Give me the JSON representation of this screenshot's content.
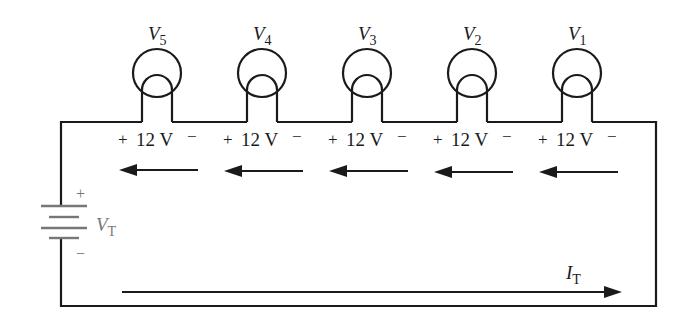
{
  "diagram": {
    "colors": {
      "wire": "#1a1a1a",
      "battery": "#777777",
      "background": "#ffffff"
    },
    "bulbs": [
      {
        "id": "V5",
        "label_main": "V",
        "label_sub": "5",
        "drop_plus": "+",
        "drop_value": "12 V",
        "drop_minus": "−"
      },
      {
        "id": "V4",
        "label_main": "V",
        "label_sub": "4",
        "drop_plus": "+",
        "drop_value": "12 V",
        "drop_minus": "−"
      },
      {
        "id": "V3",
        "label_main": "V",
        "label_sub": "3",
        "drop_plus": "+",
        "drop_value": "12 V",
        "drop_minus": "−"
      },
      {
        "id": "V2",
        "label_main": "V",
        "label_sub": "2",
        "drop_plus": "+",
        "drop_value": "12 V",
        "drop_minus": "−"
      },
      {
        "id": "V1",
        "label_main": "V",
        "label_sub": "1",
        "drop_plus": "+",
        "drop_value": "12 V",
        "drop_minus": "−"
      }
    ],
    "battery": {
      "label_main": "V",
      "label_sub": "T",
      "plus": "+",
      "minus": "−"
    },
    "current": {
      "label_main": "I",
      "label_sub": "T"
    }
  }
}
